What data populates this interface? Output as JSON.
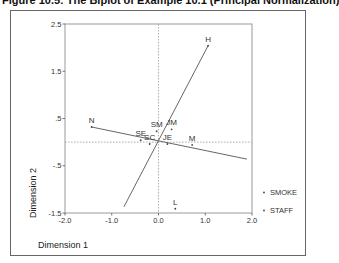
{
  "title": "Figure 10.5: The Biplot of Example 10.1 (Principal Normalization)",
  "chart_data": {
    "type": "scatter",
    "title": "Figure 10.5: The Biplot of Example 10.1 (Principal Normalization)",
    "xlabel": "Dimension 1",
    "ylabel": "Dimension 2",
    "xlim": [
      -2.0,
      2.0
    ],
    "ylim": [
      -1.5,
      2.5
    ],
    "x_ticks": [
      "-2.0",
      "-1.0",
      "0.0",
      "1.0",
      "2.0"
    ],
    "y_ticks": [
      "2.5",
      "1.5",
      ".5",
      "-.5",
      "-1.5"
    ],
    "reference_lines": {
      "x": 0,
      "y": 0,
      "style": "dotted"
    },
    "legend_position": "right",
    "series": [
      {
        "name": "SMOKE",
        "points": [
          {
            "label": "N",
            "x": -1.43,
            "y": 0.32
          },
          {
            "label": "L",
            "x": 0.36,
            "y": -1.41
          },
          {
            "label": "M",
            "x": 0.72,
            "y": -0.06
          },
          {
            "label": "H",
            "x": 1.06,
            "y": 2.04
          }
        ]
      },
      {
        "name": "STAFF",
        "points": [
          {
            "label": "SM",
            "x": -0.04,
            "y": 0.23
          },
          {
            "label": "JM",
            "x": 0.28,
            "y": 0.27
          },
          {
            "label": "SE",
            "x": -0.38,
            "y": 0.04
          },
          {
            "label": "JE",
            "x": 0.19,
            "y": -0.04
          },
          {
            "label": "SC",
            "x": -0.19,
            "y": -0.04
          }
        ]
      }
    ],
    "axis_lines": [
      {
        "name": "N-axis",
        "from": [
          -1.43,
          0.32
        ],
        "to": [
          1.89,
          -0.36
        ]
      },
      {
        "name": "H-axis",
        "from": [
          1.06,
          2.04
        ],
        "to": [
          -0.74,
          -1.37
        ]
      }
    ]
  },
  "legend": {
    "items": [
      {
        "label": "SMOKE"
      },
      {
        "label": "STAFF"
      }
    ]
  }
}
